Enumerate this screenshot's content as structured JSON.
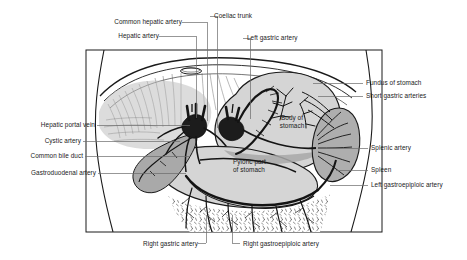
{
  "figure": {
    "colors": {
      "background": "#ffffff",
      "outline": "#1a1a1a",
      "stomach_fill": "#d5d5d5",
      "organ_fill": "#b4b4b4",
      "spleen_fill": "#aeaeae",
      "gallbladder_fill": "#a9a9a9",
      "vessel_dark": "#141414",
      "leader_line": "#6b6b6b",
      "text": "#1a1a1a"
    }
  },
  "labels": {
    "top": [
      {
        "id": "common-hepatic-artery",
        "text": "Common hepatic artery"
      },
      {
        "id": "hepatic-artery",
        "text": "Hepatic artery"
      },
      {
        "id": "coeliac-trunk",
        "text": "Coeliac trunk"
      },
      {
        "id": "left-gastric-artery",
        "text": "Left gastric artery"
      }
    ],
    "left": [
      {
        "id": "hepatic-portal-vein",
        "text": "Hepatic portal vein"
      },
      {
        "id": "cystic-artery",
        "text": "Cystic artery"
      },
      {
        "id": "common-bile-duct",
        "text": "Common bile duct"
      },
      {
        "id": "gastroduodenal-artery",
        "text": "Gastroduodenal artery"
      }
    ],
    "right": [
      {
        "id": "fundus-of-stomach",
        "text": "Fundus of stomach"
      },
      {
        "id": "short-gastric-arteries",
        "text": "Short gastric arteries"
      },
      {
        "id": "splenic-artery",
        "text": "Splenic artery"
      },
      {
        "id": "spleen",
        "text": "Spleen"
      },
      {
        "id": "left-gastroepiploic-artery",
        "text": "Left gastroepiploic artery"
      }
    ],
    "bottom": [
      {
        "id": "right-gastric-artery",
        "text": "Right gastric artery"
      },
      {
        "id": "right-gastroepiploic-artery",
        "text": "Right gastroepiploic artery"
      }
    ],
    "interior": [
      {
        "id": "body-of-stomach",
        "line1": "Body of",
        "line2": "stomach"
      },
      {
        "id": "pyloric-part-of-stomach",
        "line1": "Pyloric part",
        "line2": "of stomach"
      }
    ]
  }
}
